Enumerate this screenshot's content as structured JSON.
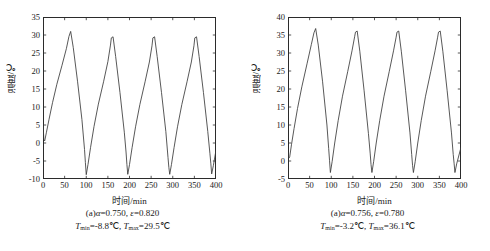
{
  "figure": {
    "panels": [
      {
        "id": "panel-a-left",
        "axis": {
          "xlabel": "时间/min",
          "ylabel": "温度/℃",
          "xticks": [
            "0",
            "50",
            "100",
            "150",
            "200",
            "250",
            "300",
            "350",
            "400"
          ],
          "yticks": [
            "35",
            "30",
            "25",
            "20",
            "15",
            "10",
            "5",
            "0",
            "-5",
            "-10"
          ],
          "xlim": [
            0,
            400
          ],
          "ylim": [
            -10,
            35
          ]
        },
        "caption": {
          "line1_prefix": "(a)",
          "line1_alpha_symbol": "α",
          "line1_alpha_value": "=0.750, ",
          "line1_eps_symbol": "ε",
          "line1_eps_value": "=0.820",
          "line1_full": "(a)α=0.750, ε=0.820",
          "line2_tmin_symbol": "T",
          "line2_tmin_sub": "min",
          "line2_tmin_value": "=-8.8℃, ",
          "line2_tmax_symbol": "T",
          "line2_tmax_sub": "max",
          "line2_tmax_value": "=29.5℃",
          "line2_full": "Tmin=-8.8℃, Tmax=29.5℃"
        }
      },
      {
        "id": "panel-a-right",
        "axis": {
          "xlabel": "时间/min",
          "ylabel": "温度/℃",
          "xticks": [
            "0",
            "50",
            "100",
            "150",
            "200",
            "250",
            "300",
            "350",
            "400"
          ],
          "yticks": [
            "40",
            "35",
            "30",
            "25",
            "20",
            "15",
            "10",
            "5",
            "0",
            "-5"
          ],
          "xlim": [
            0,
            400
          ],
          "ylim": [
            -5,
            40
          ]
        },
        "caption": {
          "line1_prefix": "(a)",
          "line1_alpha_symbol": "α",
          "line1_alpha_value": "=0.756, ",
          "line1_eps_symbol": "ε",
          "line1_eps_value": "=0.780",
          "line1_full": "(a)α=0.756, ε=0.780",
          "line2_tmin_symbol": "T",
          "line2_tmin_sub": "min",
          "line2_tmin_value": "=-3.2℃, ",
          "line2_tmax_symbol": "T",
          "line2_tmax_sub": "max",
          "line2_tmax_value": "=36.1℃",
          "line2_full": "Tmin=-3.2℃, Tmax=36.1℃"
        }
      }
    ]
  },
  "chart_data": [
    {
      "type": "line",
      "title": "(a)α=0.750, ε=0.820",
      "xlabel": "时间/min",
      "ylabel": "温度/℃",
      "xlim": [
        0,
        400
      ],
      "ylim": [
        -10,
        35
      ],
      "xticks": [
        0,
        50,
        100,
        150,
        200,
        250,
        300,
        350,
        400
      ],
      "yticks": [
        -10,
        -5,
        0,
        5,
        10,
        15,
        20,
        25,
        30,
        35
      ],
      "grid": false,
      "legend": "none",
      "line_color": "#3a3a3a",
      "annotations": {
        "T_min": -8.8,
        "T_max": 29.5,
        "alpha": 0.75,
        "epsilon": 0.82,
        "period_min": 95
      },
      "series": [
        {
          "name": "温度",
          "x": [
            0,
            2,
            4,
            8,
            14,
            22,
            32,
            44,
            54,
            60,
            64,
            70,
            80,
            90,
            96,
            98,
            100,
            104,
            110,
            118,
            128,
            140,
            150,
            156,
            158,
            162,
            168,
            178,
            188,
            192,
            194,
            196,
            200,
            206,
            214,
            224,
            236,
            246,
            252,
            254,
            258,
            264,
            274,
            284,
            289,
            291,
            293,
            297,
            303,
            311,
            321,
            333,
            343,
            349,
            351,
            355,
            361,
            371,
            381,
            386,
            388,
            390,
            394,
            400
          ],
          "y": [
            5.2,
            1.0,
            0.6,
            3.0,
            6.6,
            11.2,
            16.3,
            21.6,
            26.2,
            29.6,
            31.0,
            26.5,
            17.0,
            6.5,
            -1.8,
            -5.4,
            -8.8,
            -6.0,
            -1.2,
            4.6,
            10.8,
            17.0,
            22.6,
            27.2,
            29.2,
            29.5,
            24.0,
            14.0,
            3.0,
            -2.5,
            -6.0,
            -8.7,
            -6.0,
            -1.3,
            4.5,
            10.7,
            17.0,
            22.5,
            27.0,
            29.2,
            29.5,
            24.0,
            14.0,
            3.2,
            -4.0,
            -6.8,
            -8.7,
            -6.0,
            -1.3,
            4.5,
            10.7,
            17.0,
            22.5,
            27.0,
            29.2,
            29.5,
            24.0,
            14.0,
            3.2,
            -3.0,
            -5.6,
            -8.6,
            -6.2,
            -2.0
          ]
        }
      ]
    },
    {
      "type": "line",
      "title": "(a)α=0.756, ε=0.780",
      "xlabel": "时间/min",
      "ylabel": "温度/℃",
      "xlim": [
        0,
        400
      ],
      "ylim": [
        -5,
        40
      ],
      "xticks": [
        0,
        50,
        100,
        150,
        200,
        250,
        300,
        350,
        400
      ],
      "yticks": [
        -5,
        0,
        5,
        10,
        15,
        20,
        25,
        30,
        35,
        40
      ],
      "grid": false,
      "legend": "none",
      "line_color": "#3a3a3a",
      "annotations": {
        "T_min": -3.2,
        "T_max": 36.1,
        "alpha": 0.756,
        "epsilon": 0.78,
        "period_min": 95
      },
      "series": [
        {
          "name": "温度",
          "x": [
            0,
            2,
            4,
            8,
            14,
            22,
            32,
            44,
            54,
            60,
            64,
            70,
            80,
            90,
            94,
            96,
            98,
            102,
            108,
            116,
            126,
            138,
            148,
            154,
            156,
            160,
            166,
            176,
            186,
            190,
            192,
            194,
            198,
            204,
            212,
            222,
            234,
            244,
            250,
            252,
            256,
            262,
            272,
            282,
            286,
            288,
            290,
            294,
            300,
            308,
            318,
            330,
            340,
            346,
            348,
            352,
            358,
            368,
            378,
            382,
            384,
            386,
            390,
            400
          ],
          "y": [
            2.5,
            0.8,
            1.2,
            4.5,
            9.0,
            14.6,
            20.6,
            27.0,
            32.4,
            35.6,
            36.8,
            32.2,
            22.0,
            10.0,
            3.5,
            0.2,
            -3.2,
            -0.2,
            5.0,
            11.2,
            18.0,
            24.8,
            30.6,
            34.5,
            35.8,
            36.1,
            30.5,
            19.5,
            7.6,
            2.2,
            -1.0,
            -3.2,
            -0.2,
            5.0,
            11.2,
            18.0,
            24.8,
            30.6,
            34.4,
            35.8,
            36.1,
            30.5,
            19.5,
            7.8,
            1.8,
            -1.2,
            -3.2,
            -0.2,
            5.0,
            11.2,
            18.0,
            24.8,
            30.6,
            34.4,
            35.8,
            36.1,
            30.5,
            19.5,
            7.8,
            1.8,
            -0.6,
            -3.2,
            -0.8,
            3.8
          ]
        }
      ]
    }
  ]
}
